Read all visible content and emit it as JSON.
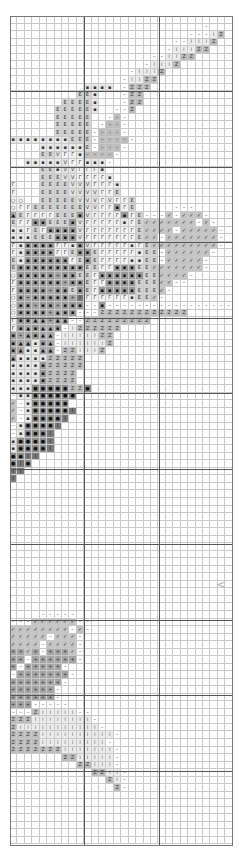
{
  "pattern": {
    "columns": 30,
    "rows": 110,
    "major_every": 10,
    "symbol_key": {
      ".": {
        "glyph": "",
        "bg": "#ffffff"
      },
      "-": {
        "glyph": "–",
        "bg": "#ffffff"
      },
      ":": {
        "glyph": "⁞",
        "bg": "#ececec"
      },
      "Z": {
        "glyph": "Z",
        "bg": "#bdbdbd"
      },
      "E": {
        "glyph": "E",
        "bg": "#d4d4d4"
      },
      "V": {
        "glyph": "V",
        "bg": "#e2e2e2"
      },
      "r": {
        "glyph": "Γ",
        "bg": "#f2f2f2"
      },
      "x": {
        "glyph": "▪",
        "bg": "#e8e8e8"
      },
      "#": {
        "glyph": "▪",
        "bg": "#9a9a9a"
      },
      "A": {
        "glyph": "▲",
        "bg": "#a8a8a8"
      },
      "o": {
        "glyph": "○",
        "bg": "#f4f4f4"
      },
      "/": {
        "glyph": "✓",
        "bg": "#c4c4c4"
      },
      "+": {
        "glyph": "+",
        "bg": "#a5a5a5"
      },
      "*": {
        "glyph": "●",
        "bg": "#8e8e8e"
      },
      "I": {
        "glyph": "I",
        "bg": "#7a7a7a"
      },
      "q": {
        "glyph": "–",
        "bg": "#bcbcbc"
      }
    },
    "grid": [
      "..............................",
      "..........................-...",
      "........................---:Z.",
      "......................--:::Z..",
      ".....................-:::ZZ...",
      "...................--::ZZ.....",
      "..................-:::Z.......",
      "................-:::Z.........",
      "...............-::ZZ..........",
      "..........xxxx.-ZZZ...........",
      ".........EEx...-ZZ............",
      ".......EEEEx...-ZZ............",
      "......EEEEEx..--Z.............",
      "......EEEEE..-q-..............",
      "......EEEEE.-qq-..............",
      "......EEEEE-qqq-..............",
      "xxxxxxxxEEE-qqqq-.............",
      "....xxxxxxE-qqq-..............",
      "....EEVrrxqqqq-...............",
      "..xxxxxVrrxxx-................",
      "....EExVVrrrx.................",
      "....EEEVVrrrrx................",
      "r...EEEEVVVrrrx...............",
      "r...EEEEVVVVrrE...............",
      "oo..EEEEEVVVrVrrE.............",
      "orrEEEEEEEVVrr#rE.....---.....",
      "AErrrrEEE#Vrrrr#rE---/-///-...",
      "Err##EEE#VrrrrrxrE///////-/-..",
      "xxrEr####VrrrrrrrE////-/////-.",
      "xxxEEE###VrrrrrrrE//-///////-.",
      "rx####rrx#VrrrrrxrE/////////-.",
      "rx####rrE##ErrrrrxEE-//////-..",
      "Ex######rE#ErrrrxxEE-/////-...",
      "E#########EErr###EE///////-...",
      "o#####+##EEr######EE////-.....",
      "r######+##Err####EEE//--......",
      "r####+##E#Er#####EEE/-........",
      "o#+#####+IrrrrrrxEE/-.........",
      "o##+##+###--#-----------------",
      "o####+A##---ZZZZZZZZZZZZ......",
      "r##AA+AA--ZZZZZZZZZ...........",
      "r#A#AA#-:ZZZZZZ...............",
      "#+A#AA-:::::ZZ................",
      "#AAx#A-::::::Z................",
      "#AxxAA-ZZ:::Z.................",
      "AxxxxZZZZZ....................",
      "xxxx#ZZZZZ....................",
      "xxxx#ZZZZ.....................",
      "xxxx#ZZZZ.....................",
      "xxx*****ZZ*...................",
      "-xx******.....................",
      "/-x*****......................",
      "/-x*****I.....................",
      "/-x****I......................",
      "-x****I.......................",
      "-x***I........................",
      "x****I........................",
      "x****I........................",
      "**II..........................",
      "*I*...........................",
      "II............................",
      "I.............................",
      "..............................",
      "..............................",
      "..............................",
      "..............................",
      "..............................",
      "..............................",
      "..............................",
      "..............................",
      "..............................",
      "..............................",
      "..............................",
      "..............................",
      "..............................",
      "..............................",
      "..............................",
      "..............................",
      "..............................",
      "....-----.....................",
      "---//////--...................",
      "////////-/-...................",
      "/////-///-....................",
      "////-////-....................",
      "++/+-+++/-....................",
      "++-++++++-....................",
      "+-+++++-......................",
      "-+++++++-.....................",
      "+++++++-......................",
      "++++++-.......................",
      "++++++-.......................",
      "+++-----......................",
      "---Z:::::--...................",
      "ZZZ::::::::-..................",
      "Z:::::::::::-.................",
      "ZZZZ::::::::::-...............",
      "ZZZZ:::::::::-................",
      "ZZZZZZZ:::::::-...............",
      ".......ZZ:::::-...............",
      ".........ZZ:::-...............",
      "...........ZZ::-..............",
      ".............Z:-..............",
      "..............Z-..............",
      "..............................",
      "..............................",
      "..............................",
      "..............................",
      "..............................",
      "..............................",
      ".............................."
    ]
  },
  "markers": [
    {
      "name": "center-arrow",
      "glyph": "<",
      "col": 28,
      "row": 75
    }
  ],
  "colors": {
    "minor_line": "#c8c8c8",
    "major_line": "#555555",
    "frame": "#777777",
    "background": "#ffffff"
  }
}
